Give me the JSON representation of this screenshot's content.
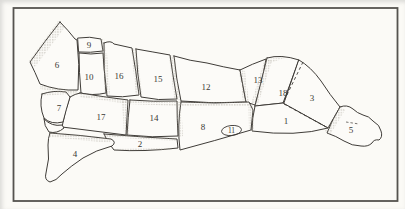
{
  "diagram": {
    "kind": "butcher-cuts-figure",
    "region_labels": [
      "1",
      "2",
      "3",
      "4",
      "5",
      "6",
      "7",
      "8",
      "9",
      "10",
      "11",
      "12",
      "13",
      "14",
      "15",
      "16",
      "17",
      "18"
    ]
  },
  "colors": {
    "line": "#3f3c38",
    "paper": "#fbfaf6",
    "stipple": "#a29c91",
    "frame": "#55534f",
    "label_text": "#3a3934"
  }
}
